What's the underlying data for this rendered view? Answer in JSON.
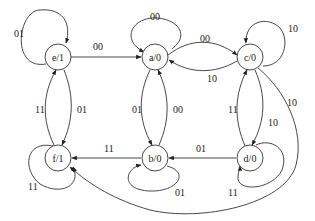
{
  "diagram": {
    "type": "state-transition-diagram",
    "colors": {
      "stroke": "#333333",
      "text": "#222222",
      "background": "#ffffff"
    },
    "nodes": [
      {
        "id": "e",
        "label": "e/1",
        "cx": 58,
        "cy": 57
      },
      {
        "id": "a",
        "label": "a/0",
        "cx": 155,
        "cy": 57
      },
      {
        "id": "c",
        "label": "c/0",
        "cx": 250,
        "cy": 57
      },
      {
        "id": "f",
        "label": "f/1",
        "cx": 58,
        "cy": 158
      },
      {
        "id": "b",
        "label": "b/0",
        "cx": 155,
        "cy": 158
      },
      {
        "id": "d",
        "label": "d/0",
        "cx": 250,
        "cy": 158
      }
    ],
    "edges": [
      {
        "from": "e",
        "to": "e",
        "label": "01"
      },
      {
        "from": "e",
        "to": "a",
        "label": "00"
      },
      {
        "from": "a",
        "to": "a",
        "label": "00"
      },
      {
        "from": "a",
        "to": "c",
        "label": "00"
      },
      {
        "from": "c",
        "to": "a",
        "label": "10"
      },
      {
        "from": "c",
        "to": "c",
        "label": "10"
      },
      {
        "from": "e",
        "to": "f",
        "label": "01"
      },
      {
        "from": "f",
        "to": "e",
        "label": "11"
      },
      {
        "from": "a",
        "to": "b",
        "label": "01"
      },
      {
        "from": "b",
        "to": "a",
        "label": "00"
      },
      {
        "from": "c",
        "to": "d",
        "label": "10"
      },
      {
        "from": "d",
        "to": "c",
        "label": "11"
      },
      {
        "from": "b",
        "to": "f",
        "label": "11"
      },
      {
        "from": "d",
        "to": "b",
        "label": "01"
      },
      {
        "from": "f",
        "to": "f",
        "label": "11"
      },
      {
        "from": "b",
        "to": "b",
        "label": "01"
      },
      {
        "from": "d",
        "to": "d",
        "label": "11"
      },
      {
        "from": "c",
        "to": "f",
        "label": "10"
      }
    ]
  }
}
